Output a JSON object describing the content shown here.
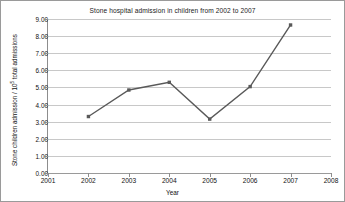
{
  "chart_data": {
    "type": "line",
    "title": "Stone hospital admission in children from 2002 to 2007",
    "xlabel": "Year",
    "ylabel": "Stone children admission / 10⁵ total admissions",
    "ylabel_prefix": "Stone children admission / 10",
    "ylabel_exponent": "5",
    "ylabel_suffix": " total admissions",
    "x": [
      2002,
      2003,
      2004,
      2005,
      2006,
      2007
    ],
    "values": [
      3.3,
      4.85,
      5.3,
      3.15,
      5.05,
      8.65
    ],
    "series": [
      {
        "name": "Stone children admission",
        "values": [
          3.3,
          4.85,
          5.3,
          3.15,
          5.05,
          8.65
        ]
      }
    ],
    "xlim": [
      2001,
      2008
    ],
    "ylim": [
      0.0,
      9.0
    ],
    "xticks": [
      2001,
      2002,
      2003,
      2004,
      2005,
      2006,
      2007,
      2008
    ],
    "xticklabels": [
      "2001",
      "2002",
      "2003",
      "2004",
      "2005",
      "2006",
      "2007",
      "2008"
    ],
    "yticks": [
      0.0,
      1.0,
      2.0,
      3.0,
      4.0,
      5.0,
      6.0,
      7.0,
      8.0,
      9.0
    ],
    "yticklabels": [
      "0.00",
      "1.00",
      "2.00",
      "3.00",
      "4.00",
      "5.00",
      "6.00",
      "7.00",
      "8.00",
      "9.00"
    ],
    "grid": "horizontal",
    "legend": "none",
    "line_color": "#595959",
    "marker": "square",
    "marker_color": "#595959",
    "gridline_color": "#c8c8c8",
    "axis_color": "#8d8d8d",
    "background": "#ffffff",
    "border_color": "#9a9a9a"
  }
}
